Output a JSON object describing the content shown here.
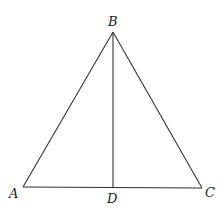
{
  "diagram": {
    "type": "triangle",
    "points": {
      "A": {
        "label": "A",
        "x": 23,
        "y": 187
      },
      "B": {
        "label": "B",
        "x": 113,
        "y": 32
      },
      "C": {
        "label": "C",
        "x": 202,
        "y": 188
      },
      "D": {
        "label": "D",
        "x": 113,
        "y": 188
      }
    },
    "segments": [
      "AB",
      "BC",
      "AC",
      "BD"
    ],
    "colors": {
      "stroke": "#333333",
      "text": "#222222",
      "background": "#ffffff"
    }
  }
}
